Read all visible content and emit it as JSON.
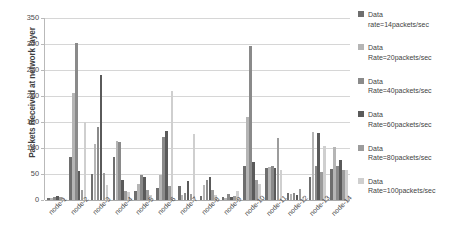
{
  "chart_data": {
    "type": "bar",
    "title": "",
    "xlabel": "",
    "ylabel": "Packets Received at network layer",
    "ylim": [
      0,
      350
    ],
    "yticks": [
      0,
      50,
      100,
      150,
      200,
      250,
      300,
      350
    ],
    "grid": true,
    "legend_position": "right",
    "categories": [
      "node-1",
      "node-2",
      "node-3",
      "node-4",
      "node-5",
      "node-6",
      "node-7",
      "node-8",
      "node-9",
      "node-10",
      "node-11",
      "node-12",
      "node-13",
      "node-14"
    ],
    "series": [
      {
        "name": "Data rate=14packets/sec",
        "label_line1": "Data",
        "label_line2": "rate=14packets/sec",
        "color": "#6e6e6e",
        "values": [
          3,
          83,
          50,
          83,
          18,
          24,
          26,
          8,
          5,
          65,
          61,
          13,
          44,
          59
        ]
      },
      {
        "name": "Data Rate=20packets/sec",
        "label_line1": "Data",
        "label_line2": "Rate=20packets/sec",
        "color": "#b5b5b5",
        "values": [
          4,
          205,
          107,
          114,
          31,
          49,
          10,
          29,
          4,
          160,
          64,
          12,
          131,
          101
        ]
      },
      {
        "name": "Data Rate=40packets/sec",
        "label_line1": "Data",
        "label_line2": "Rate=40packets/sec",
        "color": "#8a8a8a",
        "values": [
          6,
          302,
          141,
          112,
          48,
          121,
          14,
          38,
          12,
          297,
          66,
          14,
          66,
          65
        ]
      },
      {
        "name": "Data Rate=60packets/sec",
        "label_line1": "Data",
        "label_line2": "Rate=60packets/sec",
        "color": "#5a5a5a",
        "values": [
          7,
          56,
          240,
          38,
          45,
          133,
          36,
          44,
          5,
          73,
          62,
          9,
          128,
          76
        ]
      },
      {
        "name": "Data Rate=80packets/sec",
        "label_line1": "Data",
        "label_line2": "Rate=80packets/sec",
        "color": "#9c9c9c",
        "values": [
          5,
          20,
          51,
          18,
          20,
          26,
          11,
          19,
          7,
          39,
          119,
          21,
          53,
          57
        ]
      },
      {
        "name": "Data Rate=100packets/sec",
        "label_line1": "Data",
        "label_line2": "Rate=100packets/sec",
        "color": "#cfcfcf",
        "values": [
          3,
          150,
          28,
          16,
          9,
          210,
          126,
          10,
          18,
          30,
          58,
          6,
          104,
          57
        ]
      }
    ]
  }
}
